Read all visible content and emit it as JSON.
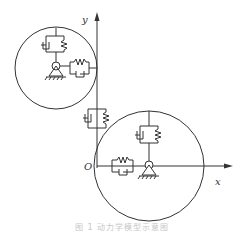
{
  "figure": {
    "axes": {
      "x_label": "x",
      "y_label": "y",
      "origin_label": "O"
    },
    "components": {
      "upper_disk": {
        "label": "upper rotor disk",
        "elements": [
          "vertical spring-damper",
          "horizontal spring-damper",
          "pivot support"
        ]
      },
      "lower_disk": {
        "label": "lower rotor disk",
        "elements": [
          "vertical spring-damper",
          "horizontal spring-damper",
          "pivot support"
        ]
      },
      "coupling": {
        "label": "spring-damper on y-axis"
      }
    },
    "caption": "图 1  动力学模型示意图"
  },
  "colors": {
    "stroke": "#333333",
    "caption": "#c8c8c8"
  }
}
